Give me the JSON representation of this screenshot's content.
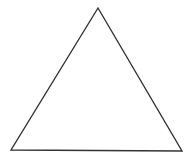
{
  "diagram": {
    "shape": "triangle",
    "stroke_color": "#333333",
    "fill_color": "#ffffff",
    "background": "#ffffff",
    "vertices": {
      "apex": [
        98,
        8
      ],
      "bottom_left": [
        11,
        150
      ],
      "bottom_right": [
        182,
        151
      ]
    }
  }
}
